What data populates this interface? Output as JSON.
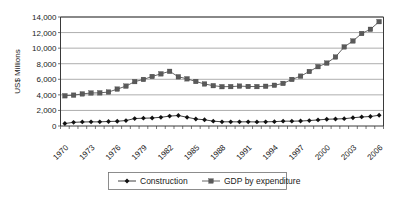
{
  "chart_data": {
    "type": "line",
    "title": "",
    "xlabel": "",
    "ylabel": "US$ Millions",
    "ylim": [
      0,
      14000
    ],
    "ytick_values": [
      0,
      2000,
      4000,
      6000,
      8000,
      10000,
      12000,
      14000
    ],
    "ytick_labels": [
      "0",
      "2,000",
      "4,000",
      "6,000",
      "8,000",
      "10,000",
      "12,000",
      "14,000"
    ],
    "grid": true,
    "legend_position": "bottom",
    "x": [
      1970,
      1971,
      1972,
      1973,
      1974,
      1975,
      1976,
      1977,
      1978,
      1979,
      1980,
      1981,
      1982,
      1983,
      1984,
      1985,
      1986,
      1987,
      1988,
      1989,
      1990,
      1991,
      1992,
      1993,
      1994,
      1995,
      1996,
      1997,
      1998,
      1999,
      2000,
      2001,
      2002,
      2003,
      2004,
      2005,
      2006
    ],
    "xtick_labels": [
      "1970",
      "",
      "",
      "1973",
      "",
      "",
      "1976",
      "",
      "",
      "1979",
      "",
      "",
      "1982",
      "",
      "",
      "1985",
      "",
      "",
      "1988",
      "",
      "",
      "1991",
      "",
      "",
      "1994",
      "",
      "",
      "1997",
      "",
      "",
      "2000",
      "",
      "",
      "2003",
      "",
      "",
      "2006"
    ],
    "xtick_labels_shown": [
      "1970",
      "1973",
      "1976",
      "1979",
      "1982",
      "1985",
      "1988",
      "1991",
      "1994",
      "1997",
      "2000",
      "2003",
      "2006"
    ],
    "series": [
      {
        "name": "Construction",
        "marker": "diamond",
        "color": "#111111",
        "values": [
          320,
          470,
          520,
          530,
          530,
          580,
          610,
          700,
          960,
          1000,
          1030,
          1120,
          1270,
          1350,
          1120,
          900,
          800,
          620,
          540,
          540,
          530,
          540,
          520,
          540,
          560,
          620,
          620,
          640,
          700,
          780,
          870,
          900,
          940,
          1060,
          1160,
          1220,
          1380
        ]
      },
      {
        "name": "GDP by expenditure",
        "marker": "square",
        "color": "#5a5a5a",
        "values": [
          3880,
          3960,
          4120,
          4240,
          4260,
          4360,
          4740,
          5120,
          5700,
          5980,
          6360,
          6700,
          7020,
          6320,
          6060,
          5720,
          5400,
          5180,
          5050,
          5060,
          5120,
          5080,
          5060,
          5100,
          5230,
          5470,
          5980,
          6400,
          7000,
          7620,
          8080,
          8860,
          10160,
          10920,
          11880,
          12420,
          13400
        ]
      }
    ]
  },
  "legend": {
    "items": [
      {
        "label": "Construction",
        "marker": "diamond"
      },
      {
        "label": "GDP by expenditure",
        "marker": "square"
      }
    ]
  },
  "axes": {
    "y_title": "US$ Millions"
  }
}
